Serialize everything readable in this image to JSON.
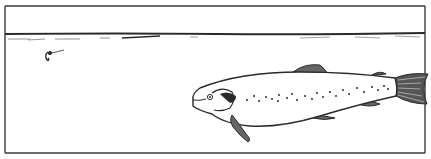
{
  "illustration": {
    "subject": "salmon swimming beneath water surface with fishing fly",
    "ink_color": "#2a2a2a",
    "background_color": "#ffffff",
    "fin_fill": "#555555"
  }
}
